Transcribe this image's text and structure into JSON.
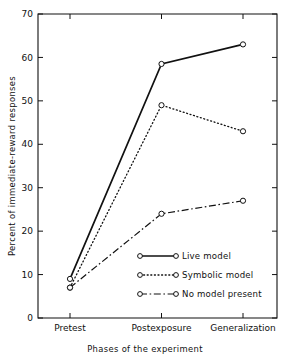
{
  "chart_data": {
    "type": "line",
    "title": "",
    "subtitle": "",
    "xlabel": "Phases of the experiment",
    "ylabel": "Percent of immediate-reward responses",
    "categories": [
      "Pretest",
      "Postexposure",
      "Generalization"
    ],
    "ylim": [
      0,
      70
    ],
    "yticks": [
      0,
      10,
      20,
      30,
      40,
      50,
      60,
      70
    ],
    "ytick_labels": [
      "0",
      "10",
      "20",
      "30",
      "40",
      "50",
      "60",
      "70"
    ],
    "grid": false,
    "legend_position": "inside-lower-center",
    "series": [
      {
        "name": "Live model",
        "style": "solid",
        "marker": "open-circle",
        "values": [
          9,
          58.5,
          63
        ]
      },
      {
        "name": "Symbolic model",
        "style": "dotted",
        "marker": "open-circle",
        "values": [
          7,
          49,
          43
        ]
      },
      {
        "name": "No model present",
        "style": "dash-dot",
        "marker": "open-circle",
        "values": [
          7,
          24,
          27
        ]
      }
    ],
    "colors": {
      "axis": "#111111",
      "series": "#111111",
      "background": "#ffffff",
      "marker_fill": "#ffffff"
    }
  },
  "legend": {
    "items": [
      {
        "label": "Live model"
      },
      {
        "label": "Symbolic model"
      },
      {
        "label": "No model present"
      }
    ]
  },
  "axes": {
    "x_title": "Phases of the experiment",
    "y_title": "Percent of immediate-reward responses"
  }
}
